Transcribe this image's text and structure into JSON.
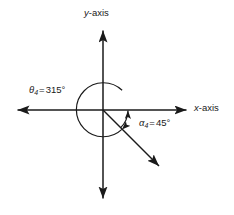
{
  "figure": {
    "type": "angle-diagram",
    "background_color": "#ffffff",
    "stroke_color": "#1a1a1a",
    "width": 234,
    "height": 215
  },
  "axes": {
    "origin": {
      "x": 103,
      "y": 110
    },
    "y_axis": {
      "label_variable": "y",
      "label_suffix": "-axis",
      "top_y": 28,
      "bottom_y": 201,
      "arrow_both_ends": true
    },
    "x_axis": {
      "label_variable": "x",
      "label_suffix": "-axis",
      "left_x": 15,
      "right_x": 189,
      "arrow_both_ends": true
    }
  },
  "angles": {
    "theta": {
      "symbol": "θ",
      "subscript": "4",
      "equals": "=",
      "value": "315°",
      "arc_direction": "counterclockwise",
      "arc_radius": 27,
      "full_text": "θ4 = 315°"
    },
    "alpha": {
      "symbol": "α",
      "subscript": "4",
      "equals": "=",
      "value": "45°",
      "arc_direction": "counterclockwise-from-ray",
      "arc_radius": 25,
      "full_text": "α4 = 45°"
    }
  },
  "ray": {
    "name": "terminal-side",
    "from": {
      "x": 103,
      "y": 110
    },
    "to": {
      "x": 162,
      "y": 169
    },
    "angle_degrees": -45,
    "arrow_end": true
  }
}
